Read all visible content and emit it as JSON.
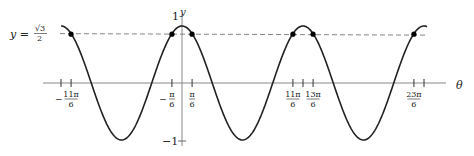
{
  "chart_data": {
    "type": "line",
    "title": "",
    "function": "y = cos(theta)",
    "xlabel": "θ",
    "ylabel": "y",
    "xlim_pi": [
      -2,
      4
    ],
    "ylim": [
      -1,
      1
    ],
    "y_ticks": [
      {
        "value": 1,
        "label": "1"
      },
      {
        "value": -1,
        "label": "−1"
      }
    ],
    "reference_line": {
      "y": 0.8660254,
      "label_lhs": "y =",
      "label_num": "√3",
      "label_den": "2",
      "style": "dashed"
    },
    "x_ticks": [
      {
        "value_pi": -2,
        "label_sign": "",
        "label_num": "",
        "label_den": ""
      },
      {
        "value_pi": -1.8333333,
        "label_sign": "−",
        "label_num": "11π",
        "label_den": "6"
      },
      {
        "value_pi": -0.1666667,
        "label_sign": "−",
        "label_num": "π",
        "label_den": "6"
      },
      {
        "value_pi": 0.1666667,
        "label_sign": "",
        "label_num": "π",
        "label_den": "6"
      },
      {
        "value_pi": 1.8333333,
        "label_sign": "",
        "label_num": "11π",
        "label_den": "6"
      },
      {
        "value_pi": 2,
        "label_sign": "",
        "label_num": "",
        "label_den": ""
      },
      {
        "value_pi": 2.1666667,
        "label_sign": "",
        "label_num": "13π",
        "label_den": "6"
      },
      {
        "value_pi": 3.8333333,
        "label_sign": "",
        "label_num": "23π",
        "label_den": "6"
      },
      {
        "value_pi": 4,
        "label_sign": "",
        "label_num": "",
        "label_den": ""
      }
    ],
    "intersection_points_pi": [
      -1.8333333,
      -0.1666667,
      0.1666667,
      1.8333333,
      2.1666667,
      3.8333333
    ],
    "curve_range_pi": [
      -2.0,
      4.05
    ],
    "colors": {
      "curve": "#222222",
      "axis": "#888888",
      "dash": "#777777",
      "point": "#000000"
    }
  }
}
